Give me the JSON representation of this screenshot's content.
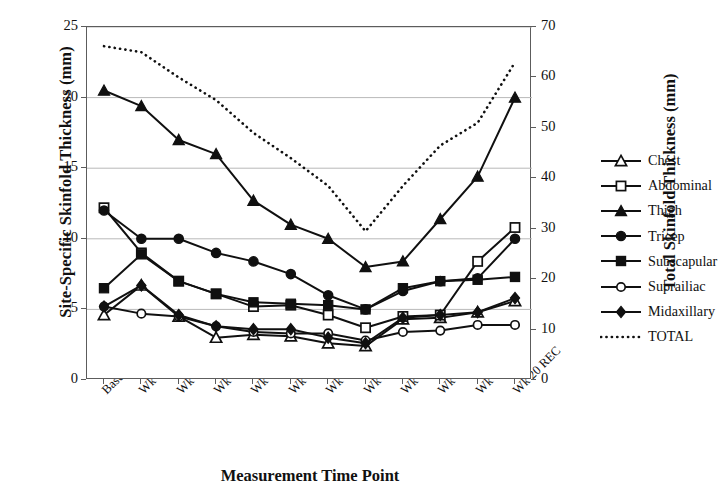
{
  "chart_data": {
    "type": "line",
    "title": "",
    "xlabel": "Measurement Time Point",
    "ylabel": "Site-Specific Skinfold Thickness (mm)",
    "ylabel_right": "Total Skinfold Thickness (mm)",
    "grid": true,
    "legend_position": "right",
    "ylim": [
      0,
      25
    ],
    "yticks": [
      "0",
      "5",
      "10",
      "15",
      "20",
      "25"
    ],
    "ylim_right": [
      0,
      70
    ],
    "yticks_right": [
      "0",
      "10",
      "20",
      "30",
      "40",
      "50",
      "60",
      "70"
    ],
    "categories": [
      "Baseline",
      "Wk 4 PREP",
      "Wk 5 PREP",
      "Wk 8 PREP",
      "Wk 11 PREP",
      "Wk 14 PREP",
      "Wk 16 PREP",
      "Wk 20 PREP",
      "Wk 5 REC",
      "Wk 10 REC",
      "Wk 14 REC",
      "Wk 20 REC"
    ],
    "series": [
      {
        "name": "Chest",
        "axis": "left",
        "marker": "triangle-open",
        "values": [
          4.6,
          6.7,
          4.5,
          3.0,
          3.2,
          3.1,
          2.6,
          2.4,
          4.3,
          4.4,
          4.8,
          5.6
        ]
      },
      {
        "name": "Abdominal",
        "axis": "left",
        "marker": "square-open",
        "values": [
          12.2,
          9.0,
          7.0,
          6.1,
          5.2,
          5.3,
          4.6,
          3.7,
          4.5,
          4.6,
          8.4,
          10.8
        ]
      },
      {
        "name": "Thigh",
        "axis": "left",
        "marker": "triangle-filled",
        "values": [
          20.5,
          19.4,
          17.0,
          16.0,
          12.7,
          11.0,
          10.0,
          8.0,
          8.4,
          11.4,
          14.4,
          20.0
        ]
      },
      {
        "name": "Tricep",
        "axis": "left",
        "marker": "circle-filled",
        "values": [
          12.0,
          10.0,
          10.0,
          9.0,
          8.4,
          7.5,
          6.0,
          5.0,
          6.3,
          7.0,
          7.2,
          10.0
        ]
      },
      {
        "name": "Subscapular",
        "axis": "left",
        "marker": "square-filled",
        "values": [
          6.5,
          8.9,
          7.0,
          6.1,
          5.5,
          5.4,
          5.3,
          5.0,
          6.5,
          7.0,
          7.1,
          7.3
        ]
      },
      {
        "name": "Suprailiac",
        "axis": "left",
        "marker": "circle-open",
        "values": [
          5.2,
          4.7,
          4.5,
          3.8,
          3.4,
          3.3,
          3.3,
          2.8,
          3.4,
          3.5,
          3.9,
          3.9
        ]
      },
      {
        "name": "Midaxillary",
        "axis": "left",
        "marker": "diamond-filled",
        "values": [
          5.2,
          6.7,
          4.6,
          3.8,
          3.6,
          3.6,
          3.0,
          2.6,
          4.4,
          4.6,
          4.8,
          5.8
        ]
      },
      {
        "name": "TOTAL",
        "axis": "right",
        "marker": "none",
        "style": "dotted",
        "values": [
          66.2,
          65.0,
          60.0,
          55.5,
          49.0,
          44.0,
          38.5,
          29.5,
          38.5,
          46.5,
          51.0,
          63.0
        ]
      }
    ]
  },
  "legend": {
    "items": [
      {
        "label": "Chest"
      },
      {
        "label": "Abdominal"
      },
      {
        "label": "Thigh"
      },
      {
        "label": "Tricep"
      },
      {
        "label": "Subscapular"
      },
      {
        "label": "Suprailiac"
      },
      {
        "label": "Midaxillary"
      },
      {
        "label": "TOTAL"
      }
    ]
  },
  "colors": {
    "line": "#101010",
    "grid": "#b9b9b9",
    "frame": "#5c5c5c",
    "text": "#111111"
  }
}
